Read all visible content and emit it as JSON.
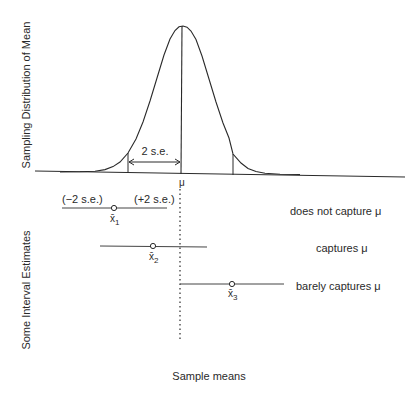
{
  "diagram": {
    "y_axis_label_top": "Sampling Distribution of Mean",
    "y_axis_label_bottom": "Some Interval Estimates",
    "x_axis_label": "Sample means",
    "mean_symbol": "μ",
    "se_label": "2 s.e.",
    "minus_label": "(−2 s.e.)",
    "plus_label": "(+2 s.e.)",
    "intervals": [
      {
        "point_label": "x̄",
        "subscript": "1",
        "description": "does not capture μ"
      },
      {
        "point_label": "x̄",
        "subscript": "2",
        "description": "captures μ"
      },
      {
        "point_label": "x̄",
        "subscript": "3",
        "description": "barely captures μ"
      }
    ]
  },
  "colors": {
    "line": "#2a2a2a",
    "background": "#ffffff"
  }
}
